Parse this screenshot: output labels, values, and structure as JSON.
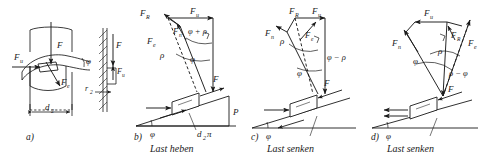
{
  "figure": {
    "title_implicit": "Kraefte am Gewinde / Schraube - schiefe Ebene",
    "background_color": "#ffffff",
    "ink_color": "#1a1a1a",
    "panel_count": 4
  },
  "panels": [
    {
      "id": "a",
      "tag": "a)",
      "caption": "",
      "kind": "thread-helix-on-screw",
      "labels": {
        "force_u": "F",
        "force_u_sub": "u",
        "force_axial": "F",
        "force_resultant": "F",
        "force_resultant_sub": "e",
        "angle_lead": "φ",
        "diameter": "d",
        "diameter_sub": "2",
        "radius_right": "r",
        "radius_right_sub": "2",
        "side_force_axial": "F",
        "side_force_u": "F",
        "side_force_u_sub": "u"
      }
    },
    {
      "id": "b",
      "tag": "b)",
      "caption": "Last heben",
      "kind": "force-triangle-incline",
      "labels": {
        "f_R": "F",
        "f_R_sub": "R",
        "f_u": "F",
        "f_u_sub": "u",
        "f_n": "F",
        "f_n_sub": "n",
        "f_e": "F",
        "f_e_sub": "e",
        "f": "F",
        "angle_sum": "φ + ρ",
        "angle_rho": "ρ",
        "angle_phi": "φ",
        "angle_incline": "φ",
        "base_label": "d",
        "base_label_sub": "2",
        "base_label_tail": "π",
        "height_label": "P"
      }
    },
    {
      "id": "c",
      "tag": "c)",
      "caption": "Last senken",
      "kind": "force-triangle-incline",
      "labels": {
        "f_R": "F",
        "f_R_sub": "R",
        "f_u": "F",
        "f_u_sub": "u",
        "f_n": "F",
        "f_n_sub": "n",
        "f_e": "F",
        "f_e_sub": "e",
        "f": "F",
        "angle_diff": "φ − ρ",
        "angle_rho": "ρ",
        "angle_phi": "φ",
        "angle_incline": "φ"
      }
    },
    {
      "id": "d",
      "tag": "d)",
      "caption": "Last senken",
      "kind": "force-triangle-incline",
      "labels": {
        "f_R": "F",
        "f_R_sub": "R",
        "f_u": "F",
        "f_u_sub": "u",
        "f_n": "F",
        "f_n_sub": "n",
        "f_e": "F",
        "f_e_sub": "e",
        "f": "F",
        "angle_diff": "ρ − φ",
        "angle_rho": "ρ",
        "angle_phi": "φ",
        "angle_incline": "φ"
      }
    }
  ]
}
